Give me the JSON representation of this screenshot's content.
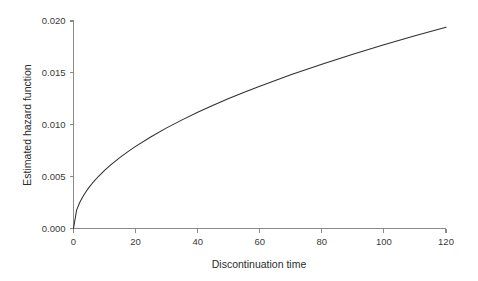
{
  "chart_data": {
    "type": "line",
    "title": "",
    "subtitle": "",
    "xlabel": "Discontinuation time",
    "ylabel": "Estimated hazard function",
    "xlim": [
      0,
      120
    ],
    "ylim": [
      0.0,
      0.02
    ],
    "xticks": [
      0,
      20,
      40,
      60,
      80,
      100,
      120
    ],
    "xtick_labels": [
      "0",
      "20",
      "40",
      "60",
      "80",
      "100",
      "120"
    ],
    "yticks": [
      0.0,
      0.005,
      0.01,
      0.015,
      0.02
    ],
    "ytick_labels": [
      "0.000",
      "0.005",
      "0.010",
      "0.015",
      "0.020"
    ],
    "grid": false,
    "legend": null,
    "legend_position": "none",
    "annotations": [],
    "series": [
      {
        "name": "Estimated hazard function",
        "color": "#2f2f2f",
        "line_width": 1.05,
        "x": [
          0,
          1,
          2,
          3,
          4,
          5,
          6,
          8,
          10,
          12,
          15,
          18,
          20,
          25,
          30,
          35,
          40,
          45,
          50,
          55,
          60,
          65,
          70,
          75,
          80,
          85,
          90,
          95,
          100,
          105,
          110,
          115,
          120
        ],
        "y": [
          0.0,
          0.00177,
          0.0025,
          0.00306,
          0.00354,
          0.00396,
          0.00434,
          0.00501,
          0.0056,
          0.00613,
          0.00686,
          0.00751,
          0.00792,
          0.00885,
          0.0097,
          0.01047,
          0.0112,
          0.01187,
          0.01252,
          0.01313,
          0.01371,
          0.01427,
          0.01481,
          0.01533,
          0.01583,
          0.01632,
          0.0168,
          0.01726,
          0.0177,
          0.01814,
          0.01857,
          0.01898,
          0.01939
        ]
      }
    ]
  },
  "axes": {
    "x_title": "Discontinuation time",
    "y_title": "Estimated hazard function",
    "axis_color": "#8a8a8a",
    "tick_color": "#8a8a8a",
    "label_color": "#3a3a3a"
  },
  "colors": {
    "background": "#ffffff",
    "curve": "#2f2f2f",
    "axis": "#8a8a8a",
    "text": "#2b2b2b"
  }
}
